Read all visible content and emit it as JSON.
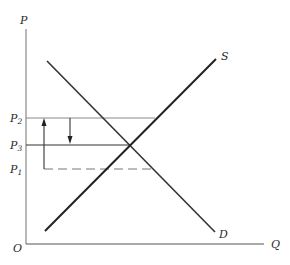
{
  "diagram": {
    "type": "supply-demand",
    "axes": {
      "y_label": "P",
      "x_label": "Q",
      "origin_label": "O"
    },
    "curves": {
      "supply_label": "S",
      "demand_label": "D"
    },
    "price_levels": [
      {
        "name": "P",
        "sub": "2",
        "style": "solid-thin",
        "extends_to": "supply"
      },
      {
        "name": "P",
        "sub": "3",
        "style": "solid",
        "extends_to": "equilibrium"
      },
      {
        "name": "P",
        "sub": "1",
        "style": "dashed",
        "extends_to": "demand"
      }
    ],
    "arrows": [
      {
        "direction": "up",
        "from": "P1",
        "to": "P2"
      },
      {
        "direction": "down",
        "from": "P2",
        "to": "P3"
      }
    ],
    "colors": {
      "line": "#2a2a2a",
      "thin_line": "#777777",
      "background": "#ffffff"
    }
  }
}
